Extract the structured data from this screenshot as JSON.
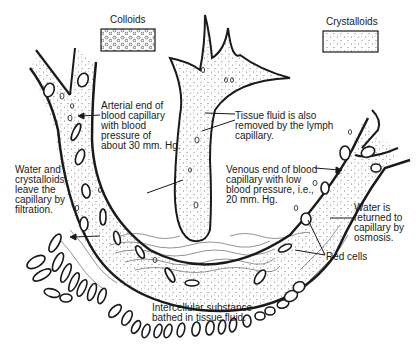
{
  "diagram": {
    "legend": [
      {
        "label": "Colloids",
        "pattern": "small circles"
      },
      {
        "label": "Crystalloids",
        "pattern": "fine dots"
      }
    ],
    "labels": {
      "arterial": "Arterial end of\nblood capillary\nwith blood\npressure of\nabout 30 mm. Hg.",
      "lymph": "Tissue fluid is also\nremoved by the lymph\ncapillary.",
      "venous": "Venous end of blood\ncapillary with low\nblood pressure, i.e.,\n20 mm. Hg.",
      "filtration": "Water and\ncrystalloids\nleave the\ncapillary by\nfiltration.",
      "osmosis": "Water is\nreturned to\ncapillary by\nosmosis.",
      "red_cells": "Red cells",
      "intercellular": "Intercellular substance\nbathed in tissue fluid."
    },
    "colors": {
      "ink": "#1a1a1a",
      "background": "#ffffff"
    }
  }
}
